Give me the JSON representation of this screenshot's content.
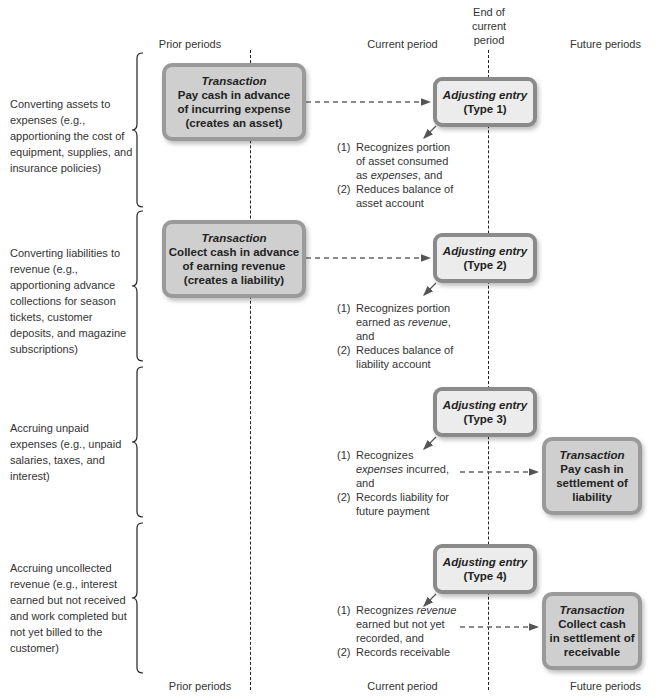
{
  "header": {
    "prior": "Prior periods",
    "current": "Current period",
    "end_of_current": [
      "End of",
      "current",
      "period"
    ],
    "future": "Future periods"
  },
  "footer": {
    "prior": "Prior periods",
    "current": "Current period",
    "future": "Future periods"
  },
  "sections": [
    {
      "category": "Converting assets to expenses (e.g., apportioning the cost of equipment, supplies, and insurance policies)",
      "transaction": {
        "title": "Transaction",
        "lines": [
          "Pay cash in advance",
          "of incurring expense",
          "(creates an asset)"
        ]
      },
      "adjusting": {
        "title": "Adjusting entry",
        "type": "(Type 1)"
      },
      "notes": [
        {
          "num": "(1)",
          "pre": "Recognizes portion of asset consumed as ",
          "em": "expenses",
          "post": ", and"
        },
        {
          "num": "(2)",
          "pre": "Reduces balance of asset account",
          "em": "",
          "post": ""
        }
      ]
    },
    {
      "category": "Converting liabilities to revenue (e.g., apportioning advance collections for season tickets, customer deposits, and magazine subscriptions)",
      "transaction": {
        "title": "Transaction",
        "lines": [
          "Collect cash in advance",
          "of earning revenue",
          "(creates a liability)"
        ]
      },
      "adjusting": {
        "title": "Adjusting entry",
        "type": "(Type 2)"
      },
      "notes": [
        {
          "num": "(1)",
          "pre": "Recognizes portion earned as ",
          "em": "revenue",
          "post": ", and"
        },
        {
          "num": "(2)",
          "pre": "Reduces balance of liability account",
          "em": "",
          "post": ""
        }
      ]
    },
    {
      "category": "Accruing unpaid expenses (e.g., unpaid salaries, taxes, and interest)",
      "transaction": {
        "title": "Transaction",
        "lines": [
          "Pay cash in",
          "settlement of",
          "liability"
        ]
      },
      "adjusting": {
        "title": "Adjusting entry",
        "type": "(Type 3)"
      },
      "notes": [
        {
          "num": "(1)",
          "pre": "Recognizes ",
          "em": "expenses",
          "post": " incurred, and"
        },
        {
          "num": "(2)",
          "pre": "Records liability for future payment",
          "em": "",
          "post": ""
        }
      ]
    },
    {
      "category": "Accruing uncollected revenue (e.g., interest earned but not received and work completed but not yet billed to the customer)",
      "transaction": {
        "title": "Transaction",
        "lines": [
          "Collect cash",
          "in settlement of",
          "receivable"
        ]
      },
      "adjusting": {
        "title": "Adjusting entry",
        "type": "(Type 4)"
      },
      "notes": [
        {
          "num": "(1)",
          "pre": "Recognizes ",
          "em": "revenue",
          "post": " earned but not yet recorded, and"
        },
        {
          "num": "(2)",
          "pre": "Records receivable",
          "em": "",
          "post": ""
        }
      ]
    }
  ]
}
